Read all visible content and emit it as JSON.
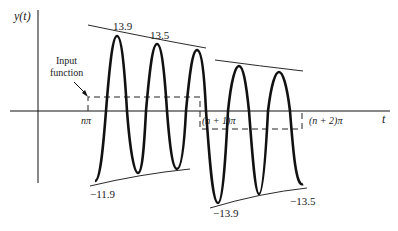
{
  "figure": {
    "type": "time-domain response diagram",
    "y_axis_label": "y(t)",
    "x_axis_label": "t",
    "x_ticks": [
      "nπ",
      "(n + 1)π",
      "(n + 2)π"
    ],
    "input_annotation": [
      "Input",
      "function"
    ],
    "peak_labels": {
      "segment1_max_first": "13.9",
      "segment1_max_second": "13.5",
      "segment1_min_first": "−11.9",
      "segment2_min_first": "−13.9",
      "segment2_min_last": "−13.5"
    },
    "colors": {
      "ink": "#111111",
      "background": "#ffffff"
    }
  }
}
